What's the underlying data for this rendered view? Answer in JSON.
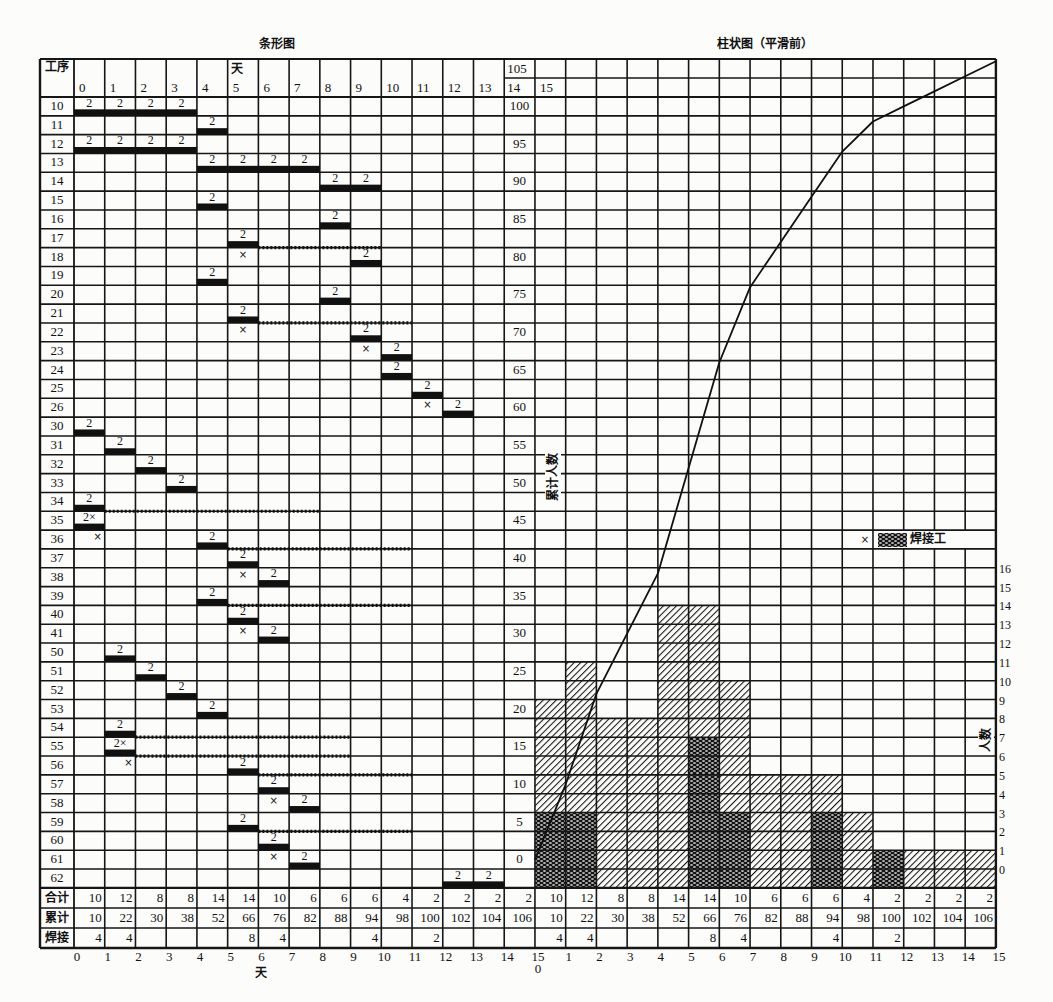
{
  "titles": {
    "gantt": "条形图",
    "histogram": "柱状图（平滑前）"
  },
  "gantt_header": {
    "process": "工序",
    "day_unit": "天",
    "days": [
      "0",
      "1",
      "2",
      "3",
      "4",
      "5",
      "6",
      "7",
      "8",
      "9",
      "10",
      "11",
      "12",
      "13"
    ],
    "col14_top": "105",
    "col14_bottom": "14",
    "col15": "15"
  },
  "histogram_axes": {
    "left_label": "累计人数",
    "left_ticks": [
      {
        "row": 0,
        "text": "100"
      },
      {
        "row": 2,
        "text": "95"
      },
      {
        "row": 4,
        "text": "90"
      },
      {
        "row": 6,
        "text": "85"
      },
      {
        "row": 8,
        "text": "80"
      },
      {
        "row": 10,
        "text": "75"
      },
      {
        "row": 12,
        "text": "70"
      },
      {
        "row": 14,
        "text": "65"
      },
      {
        "row": 16,
        "text": "60"
      },
      {
        "row": 18,
        "text": "55"
      },
      {
        "row": 20,
        "text": "50"
      },
      {
        "row": 22,
        "text": "45"
      },
      {
        "row": 24,
        "text": "40"
      },
      {
        "row": 26,
        "text": "35"
      },
      {
        "row": 28,
        "text": "30"
      },
      {
        "row": 30,
        "text": "25"
      },
      {
        "row": 32,
        "text": "20"
      },
      {
        "row": 34,
        "text": "15"
      },
      {
        "row": 36,
        "text": "10"
      },
      {
        "row": 38,
        "text": "5"
      },
      {
        "row": 40,
        "text": "0"
      }
    ],
    "right_label": "人数",
    "right_ticks": [
      "0",
      "1",
      "2",
      "3",
      "4",
      "5",
      "6",
      "7",
      "8",
      "9",
      "10",
      "11",
      "12",
      "13",
      "14",
      "15",
      "16"
    ]
  },
  "legend": {
    "marker": "×",
    "label": "焊接工"
  },
  "summary": {
    "rows": [
      {
        "label": "合计",
        "values": [
          "10",
          "12",
          "8",
          "8",
          "14",
          "14",
          "10",
          "6",
          "6",
          "6",
          "4",
          "2",
          "2",
          "2",
          "2",
          "10",
          "12",
          "8",
          "8",
          "14",
          "14",
          "10",
          "6",
          "6",
          "6",
          "4",
          "2",
          "2",
          "2",
          "2"
        ]
      },
      {
        "label": "累计",
        "values": [
          "10",
          "22",
          "30",
          "38",
          "52",
          "66",
          "76",
          "82",
          "88",
          "94",
          "98",
          "100",
          "102",
          "104",
          "106",
          "10",
          "22",
          "30",
          "38",
          "52",
          "66",
          "76",
          "82",
          "88",
          "94",
          "98",
          "100",
          "102",
          "104",
          "106"
        ]
      },
      {
        "label": "焊接",
        "values": [
          "4",
          "4",
          "",
          "",
          "",
          "8",
          "4",
          "",
          "",
          "4",
          "",
          "2",
          "",
          "",
          "",
          "4",
          "4",
          "",
          "",
          "",
          "8",
          "4",
          "",
          "",
          "4",
          "",
          "2",
          "",
          "",
          ""
        ]
      }
    ]
  },
  "bottom_axis": {
    "left": [
      "0",
      "1",
      "2",
      "3",
      "4",
      "5",
      "6",
      "7",
      "8",
      "9",
      "10",
      "11",
      "12",
      "13",
      "14",
      "15"
    ],
    "left_label": "天",
    "right_zero": "0",
    "right": [
      "1",
      "2",
      "3",
      "4",
      "5",
      "6",
      "7",
      "8",
      "9",
      "10",
      "11",
      "12",
      "13",
      "14",
      "15"
    ]
  },
  "chart_data": [
    {
      "type": "bar",
      "orientation": "horizontal",
      "title": "条形图",
      "xlabel": "天",
      "ylabel": "工序",
      "x_range": [
        0,
        15
      ],
      "grid": true,
      "tasks": [
        {
          "process": "10",
          "start": 0,
          "end": 3,
          "label": "2"
        },
        {
          "process": "11",
          "start": 4,
          "end": 4,
          "label": "2"
        },
        {
          "process": "12",
          "start": 0,
          "end": 3,
          "label": "2"
        },
        {
          "process": "13",
          "start": 4,
          "end": 7,
          "label": "2"
        },
        {
          "process": "14",
          "start": 8,
          "end": 9,
          "label": "2"
        },
        {
          "process": "15",
          "start": 4,
          "end": 4,
          "label": "2"
        },
        {
          "process": "16",
          "start": 8,
          "end": 8,
          "label": "2"
        },
        {
          "process": "17",
          "start": 5,
          "end": 5,
          "label": "2",
          "float": [
            6,
            9
          ]
        },
        {
          "process": "18",
          "start": 9,
          "end": 9,
          "label": "2",
          "marks": [
            {
              "col": 5,
              "text": "×"
            }
          ]
        },
        {
          "process": "19",
          "start": 4,
          "end": 4,
          "label": "2"
        },
        {
          "process": "20",
          "start": 8,
          "end": 8,
          "label": "2"
        },
        {
          "process": "21",
          "start": 5,
          "end": 5,
          "label": "2",
          "float": [
            6,
            10
          ]
        },
        {
          "process": "22",
          "start": 9,
          "end": 9,
          "label": "2",
          "marks": [
            {
              "col": 5,
              "text": "×"
            }
          ]
        },
        {
          "process": "23",
          "start": 10,
          "end": 10,
          "label": "2",
          "marks": [
            {
              "col": 9,
              "text": "×"
            }
          ]
        },
        {
          "process": "24",
          "start": 10,
          "end": 10,
          "label": "2"
        },
        {
          "process": "25",
          "start": 11,
          "end": 11,
          "label": "2"
        },
        {
          "process": "26",
          "start": 12,
          "end": 12,
          "label": "2",
          "marks": [
            {
              "col": 11,
              "text": "×"
            }
          ]
        },
        {
          "process": "30",
          "start": 0,
          "end": 0,
          "label": "2"
        },
        {
          "process": "31",
          "start": 1,
          "end": 1,
          "label": "2"
        },
        {
          "process": "32",
          "start": 2,
          "end": 2,
          "label": "2"
        },
        {
          "process": "33",
          "start": 3,
          "end": 3,
          "label": "2"
        },
        {
          "process": "34",
          "start": 0,
          "end": 0,
          "label": "2",
          "float": [
            1,
            7
          ]
        },
        {
          "process": "35",
          "start": 0,
          "end": 0,
          "label": "2×"
        },
        {
          "process": "36",
          "start": 4,
          "end": 4,
          "label": "2",
          "float": [
            5,
            10
          ],
          "marks": [
            {
              "col": 0,
              "text": "×",
              "align": "right"
            }
          ]
        },
        {
          "process": "37",
          "start": 5,
          "end": 5,
          "label": "2"
        },
        {
          "process": "38",
          "start": 6,
          "end": 6,
          "label": "2",
          "marks": [
            {
              "col": 5,
              "text": "×"
            }
          ]
        },
        {
          "process": "39",
          "start": 4,
          "end": 4,
          "label": "2",
          "float": [
            5,
            10
          ]
        },
        {
          "process": "40",
          "start": 5,
          "end": 5,
          "label": "2"
        },
        {
          "process": "41",
          "start": 6,
          "end": 6,
          "label": "2",
          "marks": [
            {
              "col": 5,
              "text": "×"
            }
          ]
        },
        {
          "process": "50",
          "start": 1,
          "end": 1,
          "label": "2"
        },
        {
          "process": "51",
          "start": 2,
          "end": 2,
          "label": "2"
        },
        {
          "process": "52",
          "start": 3,
          "end": 3,
          "label": "2"
        },
        {
          "process": "53",
          "start": 4,
          "end": 4,
          "label": "2"
        },
        {
          "process": "54",
          "start": 1,
          "end": 1,
          "label": "2",
          "float": [
            2,
            8
          ]
        },
        {
          "process": "55",
          "start": 1,
          "end": 1,
          "label": "2×",
          "float": [
            2,
            8
          ]
        },
        {
          "process": "56",
          "start": 5,
          "end": 5,
          "label": "2",
          "float": [
            6,
            10
          ],
          "marks": [
            {
              "col": 1,
              "text": "×",
              "align": "right"
            }
          ]
        },
        {
          "process": "57",
          "start": 6,
          "end": 6,
          "label": "2"
        },
        {
          "process": "58",
          "start": 7,
          "end": 7,
          "label": "2",
          "marks": [
            {
              "col": 6,
              "text": "×"
            }
          ]
        },
        {
          "process": "59",
          "start": 5,
          "end": 5,
          "label": "2",
          "float": [
            6,
            10
          ]
        },
        {
          "process": "60",
          "start": 6,
          "end": 6,
          "label": "2"
        },
        {
          "process": "61",
          "start": 7,
          "end": 7,
          "label": "2",
          "marks": [
            {
              "col": 6,
              "text": "×"
            }
          ]
        },
        {
          "process": "62",
          "start": 12,
          "end": 13,
          "label": "2"
        }
      ]
    },
    {
      "type": "bar",
      "title": "柱状图（平滑前）",
      "xlabel": "天",
      "ylabel": "人数",
      "y2label": "累计人数",
      "categories": [
        "0",
        "1",
        "2",
        "3",
        "4",
        "5",
        "6",
        "7",
        "8",
        "9",
        "10",
        "11",
        "12",
        "13",
        "14"
      ],
      "series": [
        {
          "name": "合计人数",
          "values": [
            10,
            12,
            8,
            8,
            14,
            14,
            10,
            6,
            6,
            6,
            4,
            2,
            2,
            2,
            2
          ]
        },
        {
          "name": "焊接工",
          "values": [
            4,
            4,
            0,
            0,
            0,
            8,
            4,
            0,
            0,
            4,
            0,
            2,
            0,
            0,
            0
          ]
        },
        {
          "name": "累计人数",
          "type": "line",
          "x": [
            0,
            1,
            2,
            3,
            4,
            5,
            6,
            7,
            8,
            9,
            10,
            11,
            12,
            13,
            14,
            15
          ],
          "values": [
            0,
            10,
            22,
            30,
            38,
            52,
            66,
            76,
            82,
            88,
            94,
            98,
            100,
            102,
            104,
            106
          ]
        }
      ],
      "drawn_bar_rows": [
        10,
        12,
        9,
        9,
        15,
        15,
        11,
        6,
        6,
        6,
        4,
        2,
        2,
        2,
        2
      ],
      "ylim": [
        0,
        16
      ],
      "y2lim": [
        0,
        105
      ],
      "grid": true,
      "legend": {
        "position": "inside plot, right",
        "entries": [
          "焊接工"
        ]
      }
    }
  ]
}
